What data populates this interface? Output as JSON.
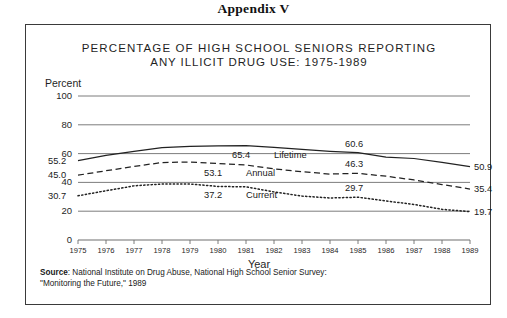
{
  "appendix": {
    "title": "Appendix V"
  },
  "figure": {
    "title_line1": "PERCENTAGE OF HIGH SCHOOL SENIORS REPORTING",
    "title_line2": "ANY ILLICIT DRUG USE: 1975-1989",
    "y_axis_label": "Percent",
    "x_axis_label": "Year",
    "source_prefix": "Source",
    "source_text": ": National Institute on Drug Abuse, National High School Senior Survey:",
    "source_text_line2": "\"Monitoring the Future,\" 1989"
  },
  "chart_data": {
    "type": "line",
    "title": "PERCENTAGE OF HIGH SCHOOL SENIORS REPORTING ANY ILLICIT DRUG USE: 1975-1989",
    "xlabel": "Year",
    "ylabel": "Percent",
    "ylim": [
      0,
      100
    ],
    "yticks": [
      0,
      20,
      40,
      60,
      80,
      100
    ],
    "grid": true,
    "legend": "inline-labels",
    "x": [
      1975,
      1976,
      1977,
      1978,
      1979,
      1980,
      1981,
      1982,
      1983,
      1984,
      1985,
      1986,
      1987,
      1988,
      1989
    ],
    "categories": [
      "1975",
      "1976",
      "1977",
      "1978",
      "1979",
      "1980",
      "1981",
      "1982",
      "1983",
      "1984",
      "1985",
      "1986",
      "1987",
      "1988",
      "1989"
    ],
    "series": [
      {
        "name": "Lifetime",
        "style": "solid",
        "values": [
          55.2,
          58.7,
          61.6,
          64.1,
          65.1,
          65.4,
          65.6,
          64.4,
          62.9,
          61.6,
          60.6,
          57.6,
          56.6,
          53.9,
          50.9
        ],
        "start_label": "55.2",
        "mid_label": "65.4",
        "mid_label_year": 1981,
        "right_mid_label": "60.6",
        "right_mid_label_year": 1985,
        "end_label": "50.9"
      },
      {
        "name": "Annual",
        "style": "dashed",
        "values": [
          45.0,
          48.1,
          51.1,
          53.8,
          54.2,
          53.1,
          52.1,
          49.4,
          47.4,
          45.8,
          46.3,
          44.3,
          41.7,
          38.5,
          35.4
        ],
        "start_label": "45.0",
        "mid_label": "53.1",
        "mid_label_year": 1980,
        "right_mid_label": "46.3",
        "right_mid_label_year": 1985,
        "end_label": "35.4"
      },
      {
        "name": "Current",
        "style": "dotted",
        "values": [
          30.7,
          34.2,
          37.6,
          38.9,
          38.9,
          37.2,
          36.9,
          33.4,
          30.5,
          29.2,
          29.7,
          27.1,
          24.7,
          21.3,
          19.7
        ],
        "start_label": "30.7",
        "mid_label": "37.2",
        "mid_label_year": 1980,
        "right_mid_label": "29.7",
        "right_mid_label_year": 1985,
        "end_label": "19.7"
      }
    ]
  }
}
